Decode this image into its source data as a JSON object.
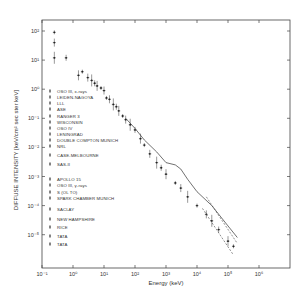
{
  "chart_data": {
    "type": "scatter",
    "title": "",
    "xlabel": "Energy (keV)",
    "ylabel": "DIFFUSE INTENSITY [keV/cm² sec ster keV]",
    "x_scale": "log",
    "y_scale": "log",
    "xlim": [
      0.1,
      10000000
    ],
    "ylim": [
      6e-07,
      250
    ],
    "x_ticks": [
      "10⁻¹",
      "10⁰",
      "10¹",
      "10²",
      "10³",
      "10⁴",
      "10⁵",
      "10⁶"
    ],
    "y_ticks": [
      "10²",
      "10¹",
      "10⁰",
      "10⁻¹",
      "10⁻²",
      "10⁻³",
      "10⁻⁴",
      "10⁻⁵"
    ],
    "grid": false,
    "legend_position": "inside-left",
    "legend": [
      "OSO III, x-rays",
      "LEIDEN-NAGOYA",
      "LLL",
      "ASE",
      "RANGER 3",
      "WISCONSIN",
      "OSO IV",
      "LENINGRAD",
      "DOUBLE COMPTON MUNICH",
      "NRL",
      "CASE-MELBOURNE",
      "SAS-II",
      "APOLLO 15",
      "OSO III, γ-rays",
      "S (OL TO)",
      "SPARK CHAMBER MUNICH",
      "SACLAY",
      "NEW HAMPSHIRE",
      "RICE",
      "TATA",
      "TATA"
    ],
    "series": [
      {
        "name": "low-energy points",
        "points": [
          [
            0.25,
            90
          ],
          [
            0.25,
            40
          ],
          [
            0.25,
            12
          ],
          [
            0.6,
            12
          ],
          [
            1.5,
            3
          ],
          [
            2,
            4
          ],
          [
            3,
            2.5
          ],
          [
            4,
            2
          ],
          [
            5,
            1.6
          ],
          [
            6,
            1.3
          ],
          [
            8,
            1.1
          ],
          [
            10,
            0.9
          ]
        ]
      },
      {
        "name": "mid-energy points",
        "points": [
          [
            12,
            0.5
          ],
          [
            15,
            0.45
          ],
          [
            20,
            0.3
          ],
          [
            25,
            0.25
          ],
          [
            30,
            0.18
          ],
          [
            40,
            0.12
          ],
          [
            50,
            0.09
          ],
          [
            70,
            0.06
          ],
          [
            100,
            0.04
          ],
          [
            150,
            0.02
          ],
          [
            200,
            0.012
          ],
          [
            300,
            0.006
          ],
          [
            500,
            0.003
          ],
          [
            700,
            0.002
          ],
          [
            1000,
            0.0012
          ],
          [
            2000,
            0.0006
          ],
          [
            3000,
            0.0004
          ],
          [
            5000,
            0.0002
          ]
        ]
      },
      {
        "name": "high-energy points",
        "points": [
          [
            10000,
            0.0001
          ],
          [
            20000,
            5e-05
          ],
          [
            30000,
            3e-05
          ],
          [
            50000,
            1.5e-05
          ],
          [
            100000,
            6e-06
          ],
          [
            150000,
            4e-06
          ]
        ]
      },
      {
        "name": "model curve",
        "points": [
          [
            50,
            0.1
          ],
          [
            100,
            0.045
          ],
          [
            200,
            0.018
          ],
          [
            500,
            0.007
          ],
          [
            1000,
            0.003
          ],
          [
            2000,
            0.0025
          ],
          [
            3000,
            0.0018
          ],
          [
            5000,
            0.0008
          ],
          [
            10000,
            0.0003
          ],
          [
            30000,
            0.0001
          ],
          [
            100000,
            2e-05
          ],
          [
            200000,
            8e-06
          ]
        ]
      },
      {
        "name": "dashed upper bound",
        "points": [
          [
            20000,
            0.0002
          ],
          [
            200000,
            5e-06
          ]
        ]
      },
      {
        "name": "dashed lower bound",
        "points": [
          [
            15000,
            8e-05
          ],
          [
            150000,
            2e-06
          ]
        ]
      }
    ]
  },
  "axes": {
    "xlabel": "Energy (keV)",
    "ylabel": "DIFFUSE INTENSITY [keV/cm² sec ster keV]"
  }
}
